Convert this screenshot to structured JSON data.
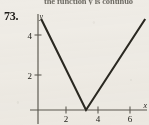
{
  "page": {
    "background_color": "#efece6",
    "ink_color": "#2a2821",
    "axis_color": "#5a574f",
    "top_text_fragment": "the function y is continuo",
    "exercise_number": "73."
  },
  "chart_data": {
    "type": "line",
    "title": "",
    "subtitle": "",
    "xlabel": "x",
    "ylabel": "y",
    "grid": false,
    "legend": null,
    "xlim": [
      -1,
      7.2
    ],
    "ylim": [
      -0.9,
      4.8
    ],
    "x_ticks": [
      2,
      4,
      6
    ],
    "x_tick_labels": [
      "2",
      "4",
      "6"
    ],
    "y_ticks": [
      2,
      4
    ],
    "y_tick_labels": [
      "2",
      "4"
    ],
    "vertex": [
      3,
      0
    ],
    "series": [
      {
        "name": "left-branch",
        "x": [
          0.2,
          3
        ],
        "y": [
          4.55,
          0
        ]
      },
      {
        "name": "right-branch",
        "x": [
          3,
          6.7
        ],
        "y": [
          0,
          4.55
        ]
      }
    ]
  },
  "axis_labels": {
    "y_axis_name": "y",
    "x_axis_name": "x"
  }
}
